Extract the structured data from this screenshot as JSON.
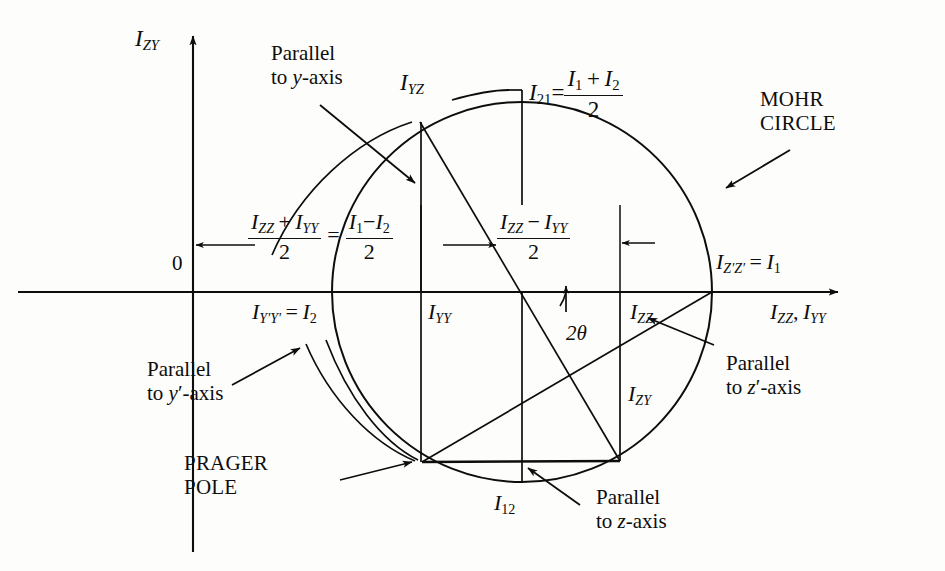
{
  "figure": {
    "kind": "mohr-circle-diagram",
    "title_label": "MOHR CIRCLE",
    "background": "#fdfdfb",
    "ink": "#0d0d0d"
  },
  "axes": {
    "vertical_axis_label_I": "I",
    "vertical_axis_label_sub": "ZY",
    "horizontal_axis_label_I1": "I",
    "horizontal_axis_label_sub1": "ZZ",
    "horizontal_axis_comma": ",",
    "horizontal_axis_label_I2": "I",
    "horizontal_axis_label_sub2": "YY",
    "origin_label": "0"
  },
  "labels": {
    "parallel_to_y_axis_l1": "Parallel",
    "parallel_to_y_axis_l2": "to y-axis",
    "parallel_to_y_axis_italic": "y",
    "parallel_to_yprime_axis_l1": "Parallel",
    "parallel_to_yprime_axis_l2": "to y′-axis",
    "parallel_to_z_axis_l1": "Parallel",
    "parallel_to_z_axis_l2": "to z-axis",
    "parallel_to_zprime_axis_l1": "Parallel",
    "parallel_to_zprime_axis_l2": "to z′-axis",
    "mohr_circle_l1": "MOHR",
    "mohr_circle_l2": "CIRCLE",
    "prager_pole_l1": "PRAGER",
    "prager_pole_l2": "POLE",
    "two_theta": "2θ"
  },
  "points": {
    "I_YZ": {
      "I": "I",
      "sub": "YZ"
    },
    "I_YY": {
      "I": "I",
      "sub": "YY"
    },
    "I_ZZ": {
      "I": "I",
      "sub": "ZZ"
    },
    "I_ZY": {
      "I": "I",
      "sub": "ZY"
    },
    "I_12": {
      "I": "I",
      "sub": "12"
    },
    "I_ZpZp_eq_I1": {
      "I": "I",
      "sub": "Z′Z′",
      "eq": "=",
      "rhs_I": "I",
      "rhs_sub": "1"
    },
    "I_YpYp_eq_I2": {
      "I": "I",
      "sub": "Y′Y′",
      "eq": "=",
      "rhs_I": "I",
      "rhs_sub": "2"
    }
  },
  "equations": {
    "center_eq": {
      "lhs_num_I1": "I",
      "lhs_num_sub1": "ZZ",
      "lhs_num_plus": "+",
      "lhs_num_I2": "I",
      "lhs_num_sub2": "YY",
      "lhs_den": "2",
      "eq": "=",
      "rhs_num_I1": "I",
      "rhs_num_sub1": "1",
      "rhs_num_minus": "−",
      "rhs_num_I2": "I",
      "rhs_num_sub2": "2",
      "rhs_den": "2"
    },
    "radius_eq": {
      "num_I1": "I",
      "num_sub1": "ZZ",
      "num_minus": "−",
      "num_I2": "I",
      "num_sub2": "YY",
      "den": "2"
    },
    "mean_eq": {
      "lhs_I": "I",
      "lhs_sub": "21",
      "eq": "=",
      "num_I1": "I",
      "num_sub1": "1",
      "num_plus": "+",
      "num_I2": "I",
      "num_sub2": "2",
      "den": "2"
    }
  },
  "geometry": {
    "circle_center_x": 522,
    "circle_center_y": 292,
    "circle_radius": 190,
    "axis_y": 292,
    "vertical_axis_x": 193,
    "point_top_x": 420,
    "point_top_y": 122,
    "point_prager_x": 422,
    "point_prager_y": 462,
    "point_bottom_right_x": 620,
    "point_bottom_right_y": 461,
    "point_right_x": 712,
    "point_left_x": 331
  }
}
